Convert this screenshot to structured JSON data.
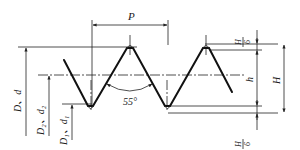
{
  "diagram": {
    "type": "thread-profile",
    "labels": {
      "pitch": "P",
      "angle": "55°",
      "major_diameter": "D、d",
      "pitch_diameter": "D₂、d₂",
      "minor_diameter": "D₁、d₁",
      "working_height": "h",
      "fundamental_height": "H",
      "top_truncation_num": "H",
      "top_truncation_den": "6",
      "bottom_truncation_num": "H",
      "bottom_truncation_den": "6"
    },
    "colors": {
      "line": "#111111",
      "background": "#ffffff"
    }
  }
}
